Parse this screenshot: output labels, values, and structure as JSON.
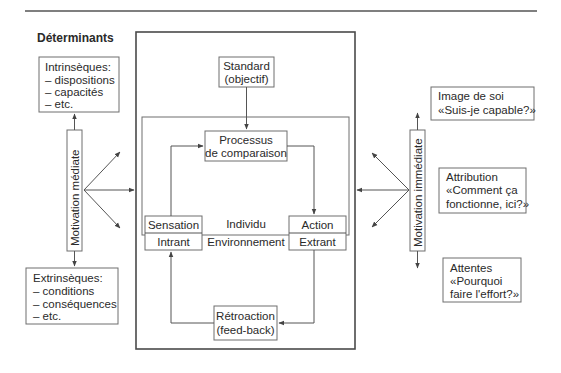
{
  "diagram": {
    "left_heading": "Déterminants",
    "right_heading": "Processus",
    "intrinsic": {
      "title": "Intrinsèques:",
      "items": [
        "– dispositions",
        "– capacités",
        "– etc."
      ]
    },
    "extrinsic": {
      "title": "Extrinsèques:",
      "items": [
        "– conditions",
        "– conséquences",
        "– etc."
      ]
    },
    "motivation_mediate": "Motivation médiate",
    "motivation_immediate": "Motivation immédiate",
    "standard": {
      "line1": "Standard",
      "line2": "(objectif)"
    },
    "comparison": {
      "line1": "Processus",
      "line2": "de comparaison"
    },
    "sensation": "Sensation",
    "intrant": "Intrant",
    "action": "Action",
    "extrant": "Extrant",
    "individu": "Individu",
    "environnement": "Environnement",
    "retroaction": {
      "line1": "Rétroaction",
      "line2": "(feed-back)"
    },
    "self_image": {
      "line1": "Image de soi",
      "line2": "«Suis-je capable?»"
    },
    "attribution": {
      "line1": "Attribution",
      "line2": "«Comment ça",
      "line3": "fonctionne, ici?»"
    },
    "expectations": {
      "line1": "Attentes",
      "line2": "«Pourquoi",
      "line3": "faire l'effort?»"
    }
  }
}
